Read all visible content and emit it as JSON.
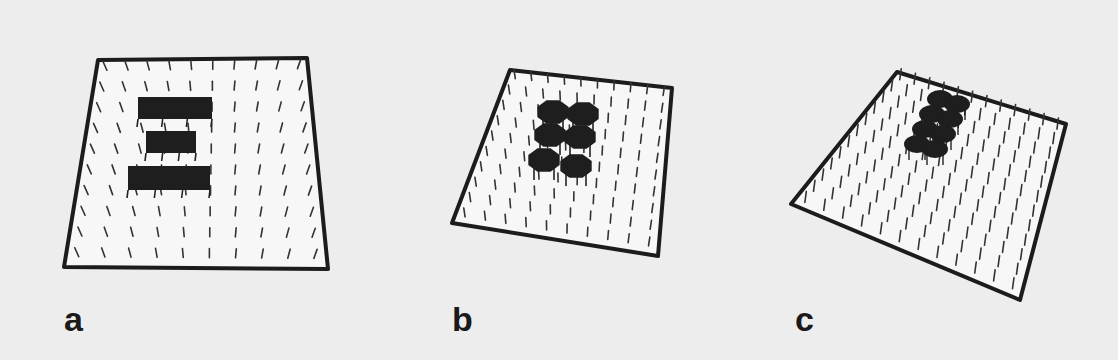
{
  "figure": {
    "background": "#ededed",
    "plate_fill": "#f7f7f7",
    "plate_border": "#1c1c1c",
    "block_fill": "#1e1e1e",
    "peg_color": "#333333",
    "panels": [
      {
        "id": "a",
        "label": "a",
        "label_pos": [
          64,
          302
        ],
        "plate": [
          [
            98,
            60
          ],
          [
            307,
            58
          ],
          [
            328,
            269
          ],
          [
            64,
            267
          ]
        ],
        "blocks": [
          {
            "shape": "rect",
            "x": 138,
            "y": 97,
            "w": 74,
            "h": 22
          },
          {
            "shape": "rect",
            "x": 146,
            "y": 131,
            "w": 50,
            "h": 22
          },
          {
            "shape": "rect",
            "x": 128,
            "y": 166,
            "w": 82,
            "h": 24
          }
        ]
      },
      {
        "id": "b",
        "label": "b",
        "label_pos": [
          452,
          302
        ],
        "plate": [
          [
            510,
            70
          ],
          [
            672,
            88
          ],
          [
            658,
            256
          ],
          [
            452,
            223
          ]
        ],
        "blocks": [
          {
            "shape": "oct",
            "cx": 553,
            "cy": 112,
            "r": 17
          },
          {
            "shape": "oct",
            "cx": 583,
            "cy": 114,
            "r": 17
          },
          {
            "shape": "oct",
            "cx": 550,
            "cy": 135,
            "r": 17
          },
          {
            "shape": "oct",
            "cx": 580,
            "cy": 137,
            "r": 17
          },
          {
            "shape": "oct",
            "cx": 544,
            "cy": 160,
            "r": 17
          },
          {
            "shape": "oct",
            "cx": 576,
            "cy": 166,
            "r": 17
          }
        ]
      },
      {
        "id": "c",
        "label": "c",
        "label_pos": [
          795,
          302
        ],
        "plate": [
          [
            897,
            72
          ],
          [
            1066,
            124
          ],
          [
            1020,
            300
          ],
          [
            791,
            204
          ]
        ],
        "blocks": [
          {
            "shape": "ell",
            "cx": 940,
            "cy": 99,
            "rx": 13,
            "ry": 9
          },
          {
            "shape": "ell",
            "cx": 957,
            "cy": 104,
            "rx": 13,
            "ry": 9
          },
          {
            "shape": "ell",
            "cx": 932,
            "cy": 114,
            "rx": 13,
            "ry": 9
          },
          {
            "shape": "ell",
            "cx": 950,
            "cy": 119,
            "rx": 13,
            "ry": 9
          },
          {
            "shape": "ell",
            "cx": 925,
            "cy": 129,
            "rx": 13,
            "ry": 9
          },
          {
            "shape": "ell",
            "cx": 943,
            "cy": 134,
            "rx": 13,
            "ry": 9
          },
          {
            "shape": "ell",
            "cx": 917,
            "cy": 144,
            "rx": 13,
            "ry": 9
          },
          {
            "shape": "ell",
            "cx": 935,
            "cy": 149,
            "rx": 13,
            "ry": 9
          }
        ]
      }
    ]
  }
}
